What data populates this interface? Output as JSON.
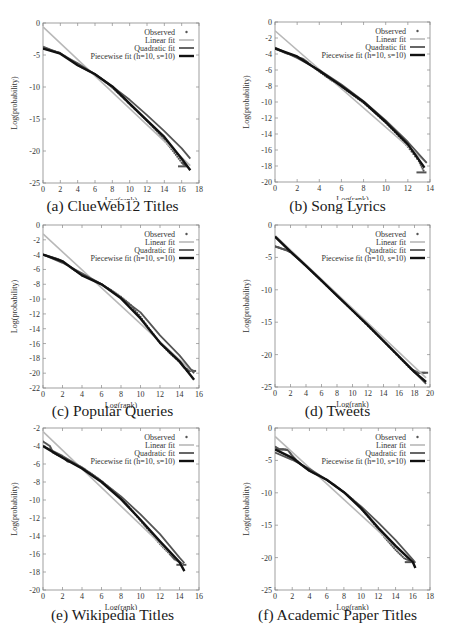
{
  "legend": {
    "observed": "Observed",
    "linear": "Linear fit",
    "quadratic": "Quadratic fit",
    "piecewise": "Piecewise fit (h=10, s=10)"
  },
  "colors": {
    "observed": "#555555",
    "linear": "#b8b8b8",
    "quadratic": "#555555",
    "piecewise": "#111111",
    "axis": "#888888"
  },
  "chart_data": [
    {
      "id": "a",
      "type": "line",
      "title": "(a) ClueWeb12 Titles",
      "xlabel": "Log(rank)",
      "ylabel": "Log(probability)",
      "xlim": [
        0,
        18
      ],
      "ylim": [
        -25,
        0
      ],
      "xticks": [
        0,
        2,
        4,
        6,
        8,
        10,
        12,
        14,
        16,
        18
      ],
      "yticks": [
        0,
        -5,
        -10,
        -15,
        -20,
        -25
      ],
      "grid": false,
      "legend_position": "upper right",
      "series": [
        {
          "name": "Observed",
          "x": [
            0,
            0.5,
            1,
            1.5,
            2,
            3,
            4,
            5,
            6,
            7,
            8,
            9,
            10,
            11,
            12,
            13,
            14,
            15,
            16,
            16.5
          ],
          "y": [
            -4.0,
            -4.1,
            -4.3,
            -4.5,
            -4.7,
            -5.6,
            -6.6,
            -7.3,
            -8.0,
            -9.0,
            -10.1,
            -11.4,
            -12.7,
            -14.0,
            -15.3,
            -16.7,
            -18.3,
            -20.0,
            -21.8,
            -22.4
          ]
        },
        {
          "name": "Linear fit",
          "x": [
            0,
            17
          ],
          "y": [
            -0.6,
            -22.3
          ]
        },
        {
          "name": "Quadratic fit",
          "x": [
            0,
            2,
            4,
            6,
            8,
            10,
            12,
            14,
            16,
            17
          ],
          "y": [
            -3.7,
            -4.8,
            -6.3,
            -8.0,
            -9.9,
            -12.0,
            -14.4,
            -16.9,
            -19.6,
            -21.2
          ]
        },
        {
          "name": "Piecewise fit (h=10, s=10)",
          "x": [
            0,
            2,
            4,
            6,
            8,
            10,
            12,
            14,
            16,
            17
          ],
          "y": [
            -4.0,
            -4.8,
            -6.6,
            -8.0,
            -9.9,
            -12.6,
            -15.2,
            -17.8,
            -21.2,
            -23.0
          ]
        }
      ]
    },
    {
      "id": "b",
      "type": "line",
      "title": "(b) Song Lyrics",
      "xlabel": "Log(rank)",
      "ylabel": "Log(probability)",
      "xlim": [
        0,
        14
      ],
      "ylim": [
        -20,
        0
      ],
      "xticks": [
        0,
        2,
        4,
        6,
        8,
        10,
        12,
        14
      ],
      "yticks": [
        0,
        -2,
        -4,
        -6,
        -8,
        -10,
        -12,
        -14,
        -16,
        -18,
        -20
      ],
      "grid": false,
      "legend_position": "upper right",
      "series": [
        {
          "name": "Observed",
          "x": [
            0,
            0.5,
            1,
            1.5,
            2,
            2.5,
            3,
            4,
            5,
            6,
            7,
            8,
            9,
            10,
            11,
            12,
            13,
            13.5
          ],
          "y": [
            -3.3,
            -3.6,
            -3.9,
            -4.1,
            -4.4,
            -4.6,
            -5.1,
            -6.2,
            -7.2,
            -8.1,
            -9.1,
            -10.1,
            -11.3,
            -12.6,
            -14.0,
            -15.6,
            -17.4,
            -18.8
          ]
        },
        {
          "name": "Linear fit",
          "x": [
            0,
            13.7
          ],
          "y": [
            -1.1,
            -17.6
          ]
        },
        {
          "name": "Quadratic fit",
          "x": [
            0,
            2,
            4,
            6,
            8,
            10,
            12,
            13.7
          ],
          "y": [
            -3.2,
            -4.5,
            -6.0,
            -7.8,
            -9.9,
            -12.3,
            -15.0,
            -17.6
          ]
        },
        {
          "name": "Piecewise fit (h=10, s=10)",
          "x": [
            0,
            2,
            4,
            6,
            8,
            10,
            12,
            13.5
          ],
          "y": [
            -3.3,
            -4.3,
            -6.1,
            -8.0,
            -10.0,
            -12.5,
            -15.3,
            -18.2
          ]
        }
      ]
    },
    {
      "id": "c",
      "type": "line",
      "title": "(c) Popular Queries",
      "xlabel": "Log(rank)",
      "ylabel": "Log(probability)",
      "xlim": [
        0,
        16
      ],
      "ylim": [
        -22,
        0
      ],
      "xticks": [
        0,
        2,
        4,
        6,
        8,
        10,
        12,
        14,
        16
      ],
      "yticks": [
        0,
        -2,
        -4,
        -6,
        -8,
        -10,
        -12,
        -14,
        -16,
        -18,
        -20,
        -22
      ],
      "grid": false,
      "legend_position": "upper right",
      "series": [
        {
          "name": "Observed",
          "x": [
            0,
            0.5,
            1,
            1.5,
            2,
            3,
            4,
            5,
            6,
            7,
            8,
            9,
            10,
            11,
            12,
            13,
            14,
            14.5,
            15.5
          ],
          "y": [
            -4.0,
            -4.2,
            -4.4,
            -4.6,
            -4.9,
            -5.9,
            -6.8,
            -7.3,
            -8.0,
            -8.8,
            -9.7,
            -10.8,
            -12.4,
            -14.2,
            -15.9,
            -17.3,
            -18.5,
            -19.3,
            -19.7
          ]
        },
        {
          "name": "Linear fit",
          "x": [
            0,
            15.5
          ],
          "y": [
            -1.2,
            -20.0
          ]
        },
        {
          "name": "Quadratic fit",
          "x": [
            0,
            2,
            4,
            6,
            8,
            10,
            12,
            14,
            15.5
          ],
          "y": [
            -4.0,
            -5.1,
            -6.5,
            -8.0,
            -9.8,
            -11.8,
            -14.9,
            -17.6,
            -20.0
          ]
        },
        {
          "name": "Piecewise fit (h=10, s=10)",
          "x": [
            0,
            2,
            4,
            6,
            8,
            10,
            12,
            14,
            15.5
          ],
          "y": [
            -4.0,
            -4.9,
            -6.8,
            -8.0,
            -9.9,
            -12.6,
            -15.9,
            -18.4,
            -20.9
          ]
        }
      ]
    },
    {
      "id": "d",
      "type": "line",
      "title": "(d) Tweets",
      "xlabel": "Log(rank)",
      "ylabel": "Log(probability)",
      "xlim": [
        0,
        20
      ],
      "ylim": [
        -25,
        0
      ],
      "xticks": [
        0,
        2,
        4,
        6,
        8,
        10,
        12,
        14,
        16,
        18,
        20
      ],
      "yticks": [
        0,
        -5,
        -10,
        -15,
        -20,
        -25
      ],
      "grid": false,
      "legend_position": "upper right",
      "series": [
        {
          "name": "Observed",
          "x": [
            0,
            0.5,
            1,
            1.5,
            2,
            3,
            4,
            6,
            8,
            10,
            12,
            14,
            16,
            17.5,
            18.5,
            19.5
          ],
          "y": [
            -3.3,
            -3.5,
            -3.7,
            -3.9,
            -4.2,
            -5.2,
            -6.3,
            -8.6,
            -10.9,
            -13.2,
            -15.6,
            -17.9,
            -20.4,
            -22.2,
            -22.8,
            -22.8
          ]
        },
        {
          "name": "Linear fit",
          "x": [
            0,
            19.5
          ],
          "y": [
            -1.6,
            -23.6
          ]
        },
        {
          "name": "Quadratic fit",
          "x": [
            0,
            2,
            4,
            6,
            8,
            10,
            12,
            14,
            16,
            18,
            19.5
          ],
          "y": [
            -1.8,
            -4.1,
            -6.3,
            -8.6,
            -10.9,
            -13.2,
            -15.5,
            -17.9,
            -20.3,
            -22.7,
            -24.5
          ]
        },
        {
          "name": "Piecewise fit (h=10, s=10)",
          "x": [
            0,
            2,
            4,
            6,
            8,
            10,
            12,
            14,
            16,
            18,
            19.5
          ],
          "y": [
            -1.8,
            -4.1,
            -6.3,
            -8.6,
            -10.9,
            -13.2,
            -15.5,
            -17.9,
            -20.3,
            -22.7,
            -24.2
          ]
        }
      ]
    },
    {
      "id": "e",
      "type": "line",
      "title": "(e) Wikipedia Titles",
      "xlabel": "Log(rank)",
      "ylabel": "Log(probability)",
      "xlim": [
        0,
        16
      ],
      "ylim": [
        -20,
        -2
      ],
      "xticks": [
        0,
        2,
        4,
        6,
        8,
        10,
        12,
        14,
        16
      ],
      "yticks": [
        -2,
        -4,
        -6,
        -8,
        -10,
        -12,
        -14,
        -16,
        -18,
        -20
      ],
      "grid": false,
      "legend_position": "upper right",
      "series": [
        {
          "name": "Observed",
          "x": [
            0,
            0.7,
            1,
            1.5,
            2,
            2.5,
            3,
            4,
            5,
            6,
            7,
            8,
            9,
            10,
            11,
            12,
            13,
            13.5,
            14.5
          ],
          "y": [
            -3.5,
            -4.0,
            -4.7,
            -5.0,
            -5.2,
            -5.7,
            -5.8,
            -6.4,
            -7.1,
            -7.9,
            -8.8,
            -9.8,
            -11.0,
            -12.3,
            -13.6,
            -14.9,
            -16.0,
            -16.6,
            -17.2
          ]
        },
        {
          "name": "Linear fit",
          "x": [
            0,
            14.3
          ],
          "y": [
            -2.4,
            -17.2
          ]
        },
        {
          "name": "Quadratic fit",
          "x": [
            0,
            2,
            4,
            6,
            8,
            10,
            12,
            14,
            14.5
          ],
          "y": [
            -4.0,
            -5.1,
            -6.4,
            -7.9,
            -9.6,
            -11.6,
            -13.8,
            -16.4,
            -17.0
          ]
        },
        {
          "name": "Piecewise fit (h=10, s=10)",
          "x": [
            0,
            2,
            4,
            6,
            8,
            10,
            12,
            14,
            14.5
          ],
          "y": [
            -4.0,
            -5.3,
            -6.5,
            -8.0,
            -9.9,
            -12.2,
            -14.6,
            -16.9,
            -17.9
          ]
        }
      ]
    },
    {
      "id": "f",
      "type": "line",
      "title": "(f) Academic Paper Titles",
      "xlabel": "Log(rank)",
      "ylabel": "Log(probability)",
      "xlim": [
        0,
        18
      ],
      "ylim": [
        -25,
        0
      ],
      "xticks": [
        0,
        2,
        4,
        6,
        8,
        10,
        12,
        14,
        16,
        18
      ],
      "yticks": [
        0,
        -5,
        -10,
        -15,
        -20,
        -25
      ],
      "grid": false,
      "legend_position": "upper right",
      "series": [
        {
          "name": "Observed",
          "x": [
            0,
            0.5,
            1,
            1.5,
            2,
            2.5,
            3,
            4,
            5,
            6,
            7,
            8,
            9,
            10,
            11,
            12,
            13,
            14,
            15,
            16
          ],
          "y": [
            -2.9,
            -3.3,
            -3.3,
            -3.4,
            -4.3,
            -5.0,
            -5.6,
            -6.6,
            -7.3,
            -8.0,
            -8.9,
            -9.9,
            -11.0,
            -12.4,
            -14.0,
            -15.7,
            -17.3,
            -18.8,
            -20.1,
            -20.7
          ]
        },
        {
          "name": "Linear fit",
          "x": [
            0,
            16.2
          ],
          "y": [
            -1.3,
            -21.0
          ]
        },
        {
          "name": "Quadratic fit",
          "x": [
            0,
            2,
            4,
            6,
            8,
            10,
            12,
            14,
            16,
            16.3
          ],
          "y": [
            -3.8,
            -4.9,
            -6.3,
            -8.0,
            -9.9,
            -12.1,
            -14.6,
            -17.3,
            -20.3,
            -20.8
          ]
        },
        {
          "name": "Piecewise fit (h=10, s=10)",
          "x": [
            0,
            2,
            4,
            6,
            8,
            10,
            12,
            14,
            16,
            16.3
          ],
          "y": [
            -3.3,
            -4.6,
            -6.6,
            -8.0,
            -9.9,
            -12.4,
            -15.4,
            -18.2,
            -20.7,
            -21.6
          ]
        }
      ]
    }
  ]
}
